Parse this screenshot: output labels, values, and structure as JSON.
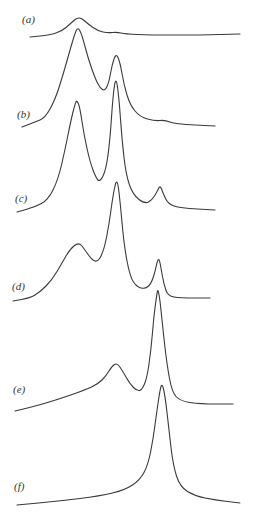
{
  "chart_data": {
    "type": "line",
    "title": "",
    "xlabel": "",
    "ylabel": "",
    "grid": false,
    "legend": "none",
    "series": [
      {
        "name": "(a)",
        "label_pos": [
          22,
          20
        ],
        "points": [
          [
            30,
            37
          ],
          [
            50,
            35
          ],
          [
            62,
            31
          ],
          [
            70,
            24
          ],
          [
            79,
            16
          ],
          [
            88,
            24
          ],
          [
            98,
            31
          ],
          [
            108,
            33
          ],
          [
            117,
            32
          ],
          [
            125,
            34
          ],
          [
            150,
            35
          ],
          [
            200,
            35
          ],
          [
            240,
            34
          ]
        ]
      },
      {
        "name": "(b)",
        "label_pos": [
          17,
          115
        ],
        "points": [
          [
            22,
            127
          ],
          [
            35,
            122
          ],
          [
            45,
            118
          ],
          [
            55,
            100
          ],
          [
            63,
            75
          ],
          [
            70,
            50
          ],
          [
            75,
            33
          ],
          [
            78,
            27
          ],
          [
            82,
            35
          ],
          [
            88,
            58
          ],
          [
            95,
            78
          ],
          [
            100,
            88
          ],
          [
            105,
            91
          ],
          [
            109,
            82
          ],
          [
            112,
            65
          ],
          [
            116,
            53
          ],
          [
            120,
            62
          ],
          [
            124,
            85
          ],
          [
            130,
            105
          ],
          [
            140,
            117
          ],
          [
            155,
            121
          ],
          [
            165,
            120
          ],
          [
            175,
            124
          ],
          [
            215,
            126
          ]
        ]
      },
      {
        "name": "(c)",
        "label_pos": [
          15,
          199
        ],
        "points": [
          [
            17,
            212
          ],
          [
            35,
            207
          ],
          [
            48,
            200
          ],
          [
            58,
            180
          ],
          [
            65,
            150
          ],
          [
            71,
            120
          ],
          [
            75,
            104
          ],
          [
            77,
            100
          ],
          [
            80,
            108
          ],
          [
            84,
            135
          ],
          [
            90,
            162
          ],
          [
            96,
            178
          ],
          [
            100,
            182
          ],
          [
            106,
            170
          ],
          [
            110,
            140
          ],
          [
            113,
            95
          ],
          [
            116,
            76
          ],
          [
            119,
            98
          ],
          [
            122,
            140
          ],
          [
            126,
            175
          ],
          [
            133,
            195
          ],
          [
            145,
            204
          ],
          [
            152,
            200
          ],
          [
            157,
            192
          ],
          [
            160,
            185
          ],
          [
            163,
            193
          ],
          [
            168,
            204
          ],
          [
            180,
            208
          ],
          [
            215,
            210
          ]
        ]
      },
      {
        "name": "(d)",
        "label_pos": [
          12,
          287
        ],
        "points": [
          [
            13,
            301
          ],
          [
            30,
            298
          ],
          [
            40,
            292
          ],
          [
            52,
            280
          ],
          [
            62,
            263
          ],
          [
            70,
            249
          ],
          [
            79,
            242
          ],
          [
            85,
            250
          ],
          [
            92,
            260
          ],
          [
            98,
            262
          ],
          [
            104,
            250
          ],
          [
            109,
            225
          ],
          [
            113,
            195
          ],
          [
            117,
            177
          ],
          [
            120,
            200
          ],
          [
            124,
            245
          ],
          [
            130,
            277
          ],
          [
            137,
            287
          ],
          [
            145,
            289
          ],
          [
            151,
            284
          ],
          [
            155,
            272
          ],
          [
            157,
            262
          ],
          [
            159,
            258
          ],
          [
            161,
            268
          ],
          [
            164,
            285
          ],
          [
            168,
            296
          ],
          [
            180,
            298
          ],
          [
            210,
            298
          ]
        ]
      },
      {
        "name": "(e)",
        "label_pos": [
          13,
          390
        ],
        "points": [
          [
            15,
            411
          ],
          [
            40,
            405
          ],
          [
            65,
            397
          ],
          [
            85,
            390
          ],
          [
            98,
            384
          ],
          [
            106,
            376
          ],
          [
            112,
            366
          ],
          [
            117,
            363
          ],
          [
            122,
            370
          ],
          [
            130,
            384
          ],
          [
            137,
            391
          ],
          [
            142,
            390
          ],
          [
            147,
            378
          ],
          [
            151,
            350
          ],
          [
            154,
            315
          ],
          [
            157,
            293
          ],
          [
            158,
            289
          ],
          [
            160,
            300
          ],
          [
            163,
            330
          ],
          [
            167,
            365
          ],
          [
            172,
            392
          ],
          [
            180,
            401
          ],
          [
            200,
            404
          ],
          [
            233,
            404
          ]
        ]
      },
      {
        "name": "(f)",
        "label_pos": [
          14,
          487
        ],
        "points": [
          [
            17,
            505
          ],
          [
            60,
            501
          ],
          [
            100,
            496
          ],
          [
            125,
            490
          ],
          [
            140,
            480
          ],
          [
            148,
            465
          ],
          [
            153,
            440
          ],
          [
            157,
            410
          ],
          [
            160,
            390
          ],
          [
            162,
            383
          ],
          [
            165,
            395
          ],
          [
            169,
            430
          ],
          [
            173,
            465
          ],
          [
            180,
            487
          ],
          [
            195,
            496
          ],
          [
            215,
            500
          ],
          [
            240,
            503
          ]
        ]
      }
    ]
  }
}
